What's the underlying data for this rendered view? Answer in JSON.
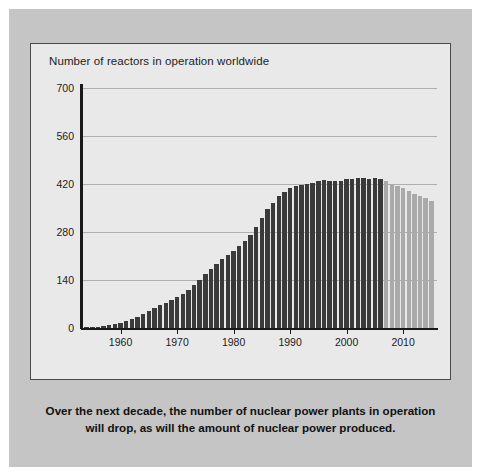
{
  "figure": {
    "caption": "Over the next decade, the number of nuclear power plants in operation will drop, as will the amount of nuclear power produced.",
    "panel_color": "#c5c5c5",
    "plot_background": "#e9e9e9"
  },
  "chart_data": {
    "type": "bar",
    "title": "Number of reactors in operation worldwide",
    "xlabel": "",
    "ylabel": "",
    "ylim": [
      0,
      700
    ],
    "xlim": [
      1953,
      2016
    ],
    "grid": true,
    "legend": false,
    "yticks": [
      0,
      140,
      280,
      420,
      560,
      700
    ],
    "ytick_labels": [
      "0",
      "140",
      "280",
      "420",
      "560",
      "700"
    ],
    "xticks": [
      1960,
      1970,
      1980,
      1990,
      2000,
      2010
    ],
    "xtick_labels": [
      "1960",
      "1970",
      "1980",
      "1990",
      "2000",
      "2010"
    ],
    "series": [
      {
        "name": "Historical (in operation)",
        "color": "#3a3a3a",
        "note": "dark bars, actual reactors in operation"
      },
      {
        "name": "Projected",
        "color": "#aaaaaa",
        "note": "light bars, projected reactors in operation"
      }
    ],
    "projection_start_year": 2007,
    "x": [
      1954,
      1955,
      1956,
      1957,
      1958,
      1959,
      1960,
      1961,
      1962,
      1963,
      1964,
      1965,
      1966,
      1967,
      1968,
      1969,
      1970,
      1971,
      1972,
      1973,
      1974,
      1975,
      1976,
      1977,
      1978,
      1979,
      1980,
      1981,
      1982,
      1983,
      1984,
      1985,
      1986,
      1987,
      1988,
      1989,
      1990,
      1991,
      1992,
      1993,
      1994,
      1995,
      1996,
      1997,
      1998,
      1999,
      2000,
      2001,
      2002,
      2003,
      2004,
      2005,
      2006,
      2007,
      2008,
      2009,
      2010,
      2011,
      2012,
      2013,
      2014,
      2015
    ],
    "values": [
      1,
      2,
      3,
      5,
      8,
      12,
      16,
      20,
      26,
      32,
      40,
      50,
      58,
      66,
      74,
      82,
      90,
      100,
      112,
      125,
      140,
      158,
      172,
      186,
      200,
      212,
      224,
      238,
      254,
      272,
      296,
      322,
      346,
      366,
      384,
      398,
      408,
      414,
      418,
      421,
      424,
      428,
      432,
      430,
      428,
      430,
      434,
      436,
      438,
      437,
      436,
      437,
      435,
      428,
      420,
      414,
      408,
      400,
      392,
      386,
      378,
      370
    ],
    "value_units": "reactors"
  }
}
